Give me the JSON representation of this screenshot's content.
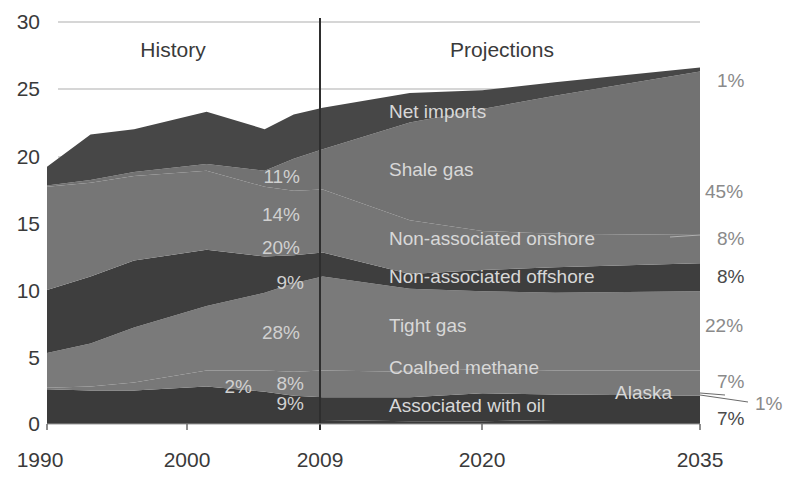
{
  "chart_data": {
    "type": "area",
    "title": "",
    "xlabel": "",
    "ylabel": "",
    "ylim": [
      0,
      30
    ],
    "xlim": [
      1990,
      2035
    ],
    "yticks": [
      0,
      5,
      10,
      15,
      20,
      25,
      30
    ],
    "xticks": [
      1990,
      2000,
      2009,
      2020,
      2035
    ],
    "grid": true,
    "divider_year": 2009,
    "regions": {
      "history": "History",
      "projections": "Projections"
    },
    "x": [
      1990,
      1993,
      1996,
      2001,
      2005,
      2007,
      2009,
      2015,
      2020,
      2025,
      2035
    ],
    "series": [
      {
        "name": "Alaska",
        "values": [
          0.3,
          0.3,
          0.3,
          0.3,
          0.3,
          0.3,
          0.3,
          0.2,
          0.2,
          0.3,
          0.3
        ]
      },
      {
        "name": "Associated with oil",
        "values": [
          2.3,
          2.2,
          2.2,
          2.5,
          2.1,
          1.8,
          1.7,
          1.8,
          2.1,
          1.9,
          1.8
        ]
      },
      {
        "name": "Coalbed methane",
        "values": [
          0.1,
          0.3,
          0.6,
          1.2,
          1.6,
          1.8,
          2.0,
          1.9,
          1.8,
          1.8,
          1.9
        ]
      },
      {
        "name": "Tight gas",
        "values": [
          2.6,
          3.2,
          4.1,
          4.8,
          5.8,
          6.6,
          7.0,
          6.2,
          5.8,
          5.8,
          5.9
        ]
      },
      {
        "name": "Non-associated offshore",
        "values": [
          4.7,
          5.0,
          5.0,
          4.2,
          2.7,
          2.1,
          1.8,
          1.1,
          1.6,
          1.9,
          2.1
        ]
      },
      {
        "name": "Non-associated onshore",
        "values": [
          7.7,
          7.0,
          6.3,
          5.9,
          5.2,
          4.8,
          4.7,
          4.0,
          2.9,
          2.5,
          2.1
        ]
      },
      {
        "name": "Shale gas",
        "values": [
          0.1,
          0.2,
          0.3,
          0.5,
          1.2,
          2.4,
          3.0,
          7.3,
          9.1,
          10.3,
          12.2
        ]
      },
      {
        "name": "Net imports",
        "values": [
          1.4,
          3.4,
          3.2,
          3.9,
          3.1,
          3.3,
          3.1,
          2.2,
          1.4,
          1.0,
          0.3
        ]
      }
    ],
    "annotations": {
      "history_2009_pct": [
        {
          "series": "Net imports",
          "label": "11%"
        },
        {
          "series": "Shale gas",
          "label": "14%"
        },
        {
          "series": "Non-associated onshore",
          "label": "20%"
        },
        {
          "series": "Non-associated offshore",
          "label": "9%"
        },
        {
          "series": "Tight gas",
          "label": "28%"
        },
        {
          "series": "Coalbed methane",
          "label": "8%"
        },
        {
          "series": "Associated with oil",
          "label": "9%"
        },
        {
          "series": "Alaska",
          "label": "2%"
        }
      ],
      "projection_2035_pct": [
        {
          "series": "Net imports",
          "label": "1%"
        },
        {
          "series": "Shale gas",
          "label": "45%"
        },
        {
          "series": "Non-associated onshore",
          "label": "8%"
        },
        {
          "series": "Non-associated offshore",
          "label": "8%"
        },
        {
          "series": "Tight gas",
          "label": "22%"
        },
        {
          "series": "Coalbed methane",
          "label": "7%"
        },
        {
          "series": "Alaska",
          "label": "1%"
        },
        {
          "series": "Associated with oil",
          "label": "7%"
        }
      ]
    }
  },
  "labels": {
    "history": "History",
    "projections": "Projections",
    "net_imports": "Net imports",
    "shale_gas": "Shale gas",
    "onshore": "Non-associated onshore",
    "offshore": "Non-associated offshore",
    "tight_gas": "Tight gas",
    "coalbed": "Coalbed methane",
    "associated": "Associated with oil",
    "alaska": "Alaska"
  },
  "hist_pct": {
    "net_imports": "11%",
    "shale": "14%",
    "onshore": "20%",
    "offshore": "9%",
    "tight": "28%",
    "coalbed": "8%",
    "associated": "9%",
    "alaska": "2%"
  },
  "proj_pct": {
    "net_imports": "1%",
    "shale": "45%",
    "onshore": "8%",
    "offshore": "8%",
    "tight": "22%",
    "coalbed": "7%",
    "alaska": "1%",
    "associated": "7%"
  },
  "axis": {
    "y": [
      "0",
      "5",
      "10",
      "15",
      "20",
      "25",
      "30"
    ],
    "x": [
      "1990",
      "2000",
      "2009",
      "2020",
      "2035"
    ]
  },
  "colors": {
    "dark": "#3b3b3b",
    "mid": "#6f6f6f",
    "light": "#7d7d7d",
    "grid": "#c8c8c8",
    "divider": "#2e2e2e"
  }
}
